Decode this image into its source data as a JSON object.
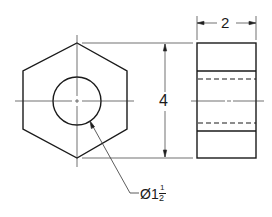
{
  "drawing": {
    "title": "Hex nut orthographic views",
    "front_view": {
      "shape": "hexagon",
      "hole_diameter_label": "Ø1½",
      "hole_symbol": "Ø",
      "hole_whole": "1",
      "hole_frac_num": "1",
      "hole_frac_den": "2"
    },
    "side_view": {
      "width_label": "2"
    },
    "height_label": "4"
  },
  "colors": {
    "line": "#1a1a1a",
    "background": "#ffffff"
  }
}
